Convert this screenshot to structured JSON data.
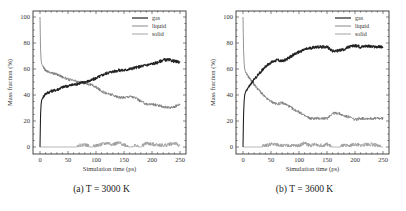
{
  "figure": {
    "panels": [
      {
        "id": "a",
        "caption": "(a) T = 3000 K"
      },
      {
        "id": "b",
        "caption": "(b) T = 3600 K"
      }
    ]
  },
  "colors": {
    "gas": "#222222",
    "liquid": "#7a7a7a",
    "solid": "#9a9a9a",
    "frame": "#333333"
  },
  "chart_data": [
    {
      "type": "line",
      "title": "(a) T = 3000 K",
      "xlabel": "Simulation time (ps)",
      "ylabel": "Mass fraction (%)",
      "xlim": [
        0,
        250
      ],
      "ylim": [
        0,
        100
      ],
      "xticks": [
        0,
        50,
        100,
        150,
        200,
        250
      ],
      "yticks": [
        0,
        20,
        40,
        60,
        80,
        100
      ],
      "grid": false,
      "legend_position": "upper right",
      "legend": [
        "gas",
        "liquid",
        "solid"
      ],
      "x": [
        0,
        1,
        2,
        3,
        5,
        8,
        10,
        15,
        20,
        30,
        40,
        50,
        60,
        70,
        80,
        90,
        100,
        110,
        120,
        130,
        140,
        150,
        160,
        170,
        180,
        190,
        200,
        210,
        220,
        230,
        240,
        250
      ],
      "series": [
        {
          "name": "gas",
          "values": [
            0,
            25,
            33,
            36,
            38,
            40,
            41,
            42,
            43,
            44,
            46,
            47,
            48,
            49,
            50,
            51,
            53,
            55,
            57,
            58,
            59,
            59,
            60,
            61,
            62,
            63,
            64,
            65,
            67,
            67,
            66,
            65
          ]
        },
        {
          "name": "liquid",
          "values": [
            100,
            75,
            67,
            64,
            62,
            60,
            59,
            58,
            57,
            56,
            54,
            52,
            51,
            50,
            49,
            48,
            46,
            43,
            41,
            40,
            38,
            38,
            39,
            38,
            35,
            33,
            33,
            32,
            31,
            30,
            31,
            33
          ]
        },
        {
          "name": "solid",
          "values": [
            0,
            0,
            0,
            0,
            0,
            0,
            0,
            0,
            0,
            0,
            0,
            0,
            0,
            1,
            2,
            0,
            1,
            2,
            3,
            2,
            3,
            2,
            0,
            1,
            0,
            3,
            2,
            2,
            1,
            2,
            3,
            1
          ]
        }
      ]
    },
    {
      "type": "line",
      "title": "(b) T = 3600 K",
      "xlabel": "Simulation time (ps)",
      "ylabel": "Mass fraction (%)",
      "xlim": [
        0,
        250
      ],
      "ylim": [
        0,
        100
      ],
      "xticks": [
        0,
        50,
        100,
        150,
        200,
        250
      ],
      "yticks": [
        0,
        20,
        40,
        60,
        80,
        100
      ],
      "grid": false,
      "legend_position": "upper right",
      "legend": [
        "gas",
        "liquid",
        "solid"
      ],
      "x": [
        0,
        1,
        2,
        3,
        5,
        8,
        10,
        15,
        20,
        30,
        40,
        50,
        60,
        70,
        80,
        90,
        100,
        110,
        120,
        130,
        140,
        150,
        160,
        170,
        180,
        190,
        200,
        210,
        220,
        230,
        240,
        250
      ],
      "series": [
        {
          "name": "gas",
          "values": [
            0,
            25,
            35,
            40,
            43,
            45,
            46,
            49,
            52,
            57,
            62,
            65,
            67,
            66,
            68,
            71,
            73,
            75,
            76,
            77,
            77,
            77,
            74,
            74,
            75,
            77,
            78,
            77,
            78,
            77,
            77,
            77
          ]
        },
        {
          "name": "liquid",
          "values": [
            100,
            75,
            65,
            60,
            57,
            55,
            54,
            51,
            48,
            43,
            38,
            35,
            33,
            34,
            32,
            29,
            27,
            24,
            22,
            22,
            22,
            22,
            26,
            26,
            24,
            23,
            21,
            22,
            22,
            22,
            22,
            22
          ]
        },
        {
          "name": "solid",
          "values": [
            0,
            0,
            0,
            0,
            0,
            0,
            0,
            0,
            0,
            0,
            1,
            2,
            2,
            1,
            1,
            1,
            1,
            3,
            1,
            2,
            1,
            2,
            0,
            0,
            1,
            1,
            2,
            1,
            2,
            2,
            1,
            0
          ]
        }
      ]
    }
  ]
}
